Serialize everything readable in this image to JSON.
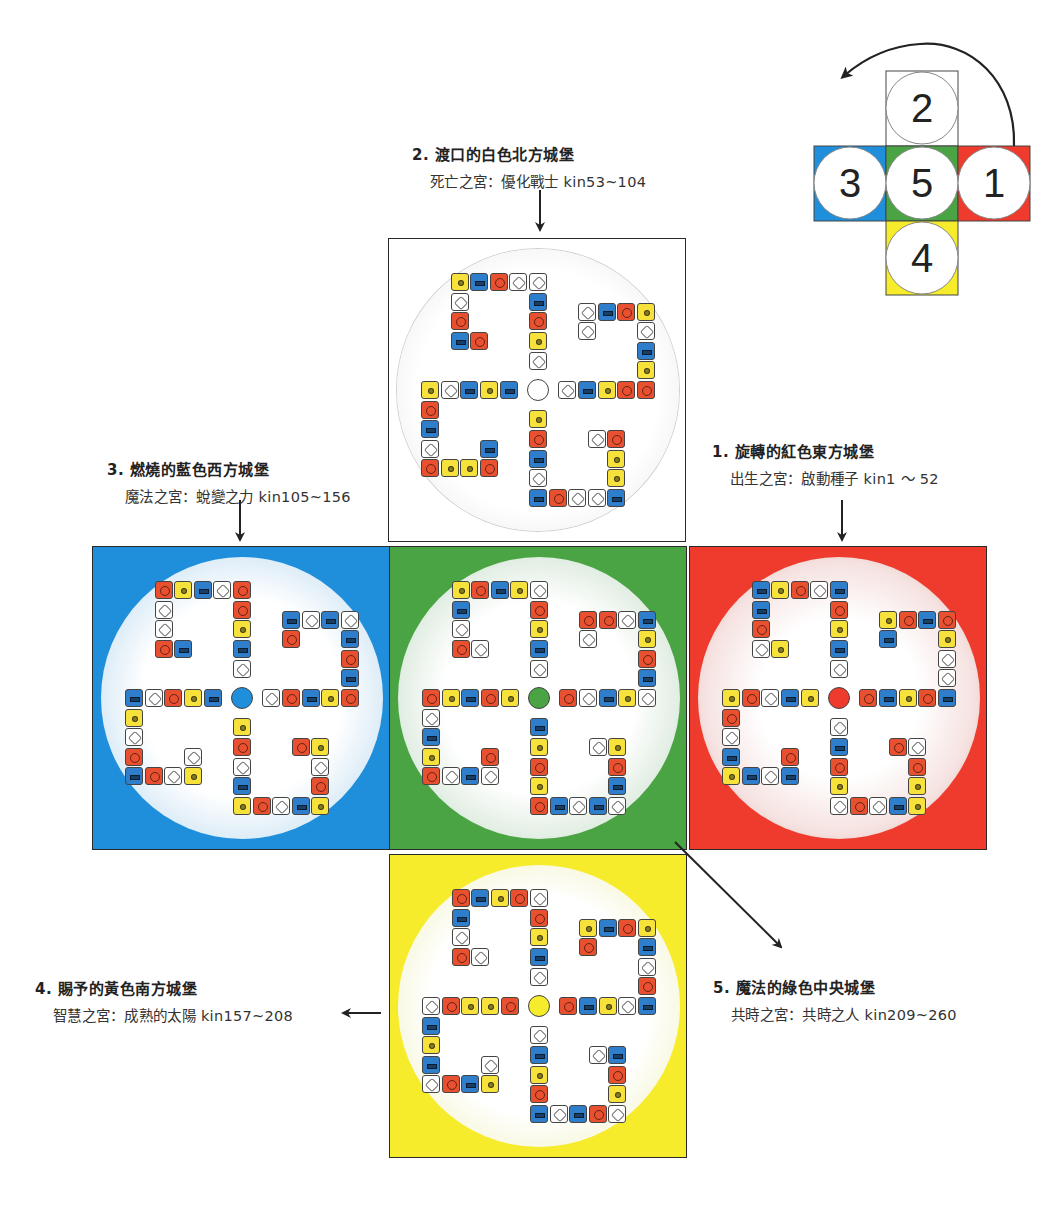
{
  "header": {
    "clipped": true
  },
  "colors": {
    "red": "#ee3b2d",
    "blue": "#1f8fdc",
    "yellow": "#f6ec2c",
    "green": "#4aa444",
    "white": "#ffffff",
    "tile_red": "#e8502f",
    "tile_blue": "#2f7ecb",
    "tile_yellow": "#f7e23c"
  },
  "castles": [
    {
      "id": "north",
      "number": 2,
      "color": "white",
      "title": "2. 渡口的白色北方城堡",
      "subtitle": "死亡之宮：優化戰士 kin53~104",
      "tiles": "wyrbwwrbywrbrwbyrrybwyrbwwyrbwbrwwbyyrwbybwyrbwryyrb"
    },
    {
      "id": "west",
      "number": 3,
      "color": "blue",
      "title": "3. 燃燒的藍色西方城堡",
      "subtitle": "魔法之宮：蛻變之力 kin105~156",
      "tiles": "wbyrrwbyrwwrbwrbyrbrbwbwbryrwbyrwbyrwyrbyrwbywrbrwy"
    },
    {
      "id": "east",
      "number": 1,
      "color": "red",
      "title": "1. 旋轉的紅色東方城堡",
      "subtitle": "出生之宮：啟動種子 kin1 ～ 52",
      "tiles": "wbyrbwrybbrwyrbyrbwwyrbrybwbrywrwbyyrwrybwryrwbybwbr"
    },
    {
      "id": "center",
      "number": 5,
      "color": "green",
      "title": "5. 魔法的綠色中央城堡",
      "subtitle": "共時之宮：共時之人 kin209~260",
      "tiles": "wbyrwybrybwrwrwbywbrybwrrwbyryrbwbwbrywyrbyrwbyrwbwr"
    },
    {
      "id": "south",
      "number": 4,
      "color": "yellow",
      "title": "4. 賜予的黃色南方城堡",
      "subtitle": "智慧之宮：成熟的太陽 kin157~208",
      "tiles": "wbyrwrybrbwrwrbywbrwbyrbyrwbyrbwbrwyrbwryyrwbybwrbyw"
    }
  ],
  "legend": {
    "cells": [
      {
        "number": "2",
        "color": "white"
      },
      {
        "number": "3",
        "color": "blue"
      },
      {
        "number": "5",
        "color": "green"
      },
      {
        "number": "1",
        "color": "red"
      },
      {
        "number": "4",
        "color": "yellow"
      }
    ],
    "arrow": "curved-counterclockwise"
  }
}
